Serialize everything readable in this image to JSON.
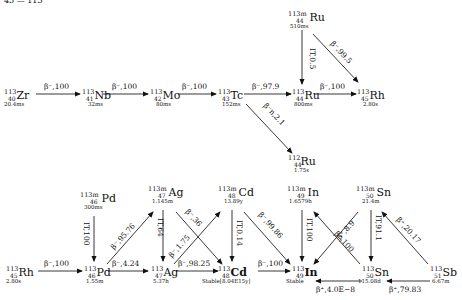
{
  "header": {
    "partial_text": "43 — 113"
  },
  "nuclides": {
    "zr113": {
      "a": "113",
      "z": "40",
      "sym": "Zr",
      "hl": "20.4ms"
    },
    "nb113": {
      "a": "113",
      "z": "41",
      "sym": "Nb",
      "hl": "32ms"
    },
    "mo113": {
      "a": "113",
      "z": "42",
      "sym": "Mo",
      "hl": "80ms"
    },
    "tc113": {
      "a": "113",
      "z": "43",
      "sym": "Tc",
      "hl": "152ms"
    },
    "ru113m": {
      "a": "113m",
      "z": "44",
      "sym": "Ru",
      "hl": "510ms"
    },
    "ru113": {
      "a": "113",
      "z": "44",
      "sym": "Ru",
      "hl": "800ms"
    },
    "rh113_top": {
      "a": "113",
      "z": "45",
      "sym": "Rh",
      "hl": "2.80s"
    },
    "ru112": {
      "a": "112",
      "z": "44",
      "sym": "Ru",
      "hl": "1.75s"
    },
    "pd113m": {
      "a": "113m",
      "z": "46",
      "sym": "Pd",
      "hl": "300ms"
    },
    "ag113m": {
      "a": "113m",
      "z": "47",
      "sym": "Ag",
      "hl": "1.145m"
    },
    "cd113m": {
      "a": "113m",
      "z": "48",
      "sym": "Cd",
      "hl": "13.89y"
    },
    "in113m": {
      "a": "113m",
      "z": "49",
      "sym": "In",
      "hl": "1.6579h"
    },
    "sn113m": {
      "a": "113m",
      "z": "50",
      "sym": "Sn",
      "hl": "21.4m"
    },
    "rh113": {
      "a": "113",
      "z": "45",
      "sym": "Rh",
      "hl": "2.80s"
    },
    "pd113": {
      "a": "113",
      "z": "46",
      "sym": "Pd",
      "hl": "1.55m"
    },
    "ag113": {
      "a": "113",
      "z": "47",
      "sym": "Ag",
      "hl": "5.37h"
    },
    "cd113": {
      "a": "113",
      "z": "48",
      "sym": "Cd",
      "hl": "Stable[8.04E15y]"
    },
    "in113": {
      "a": "113",
      "z": "49",
      "sym": "In",
      "hl": "Stable"
    },
    "sn113": {
      "a": "113",
      "z": "50",
      "sym": "Sn",
      "hl": "115.08d"
    },
    "sb113": {
      "a": "113",
      "z": "51",
      "sym": "Sb",
      "hl": "6.67m"
    }
  },
  "decays": [
    {
      "from": "Zr-113",
      "to": "Nb-113",
      "label": "β⁻,100"
    },
    {
      "from": "Nb-113",
      "to": "Mo-113",
      "label": "β⁻,100"
    },
    {
      "from": "Mo-113",
      "to": "Tc-113",
      "label": "β⁻,100"
    },
    {
      "from": "Tc-113",
      "to": "Ru-113",
      "label": "β⁻,97.9"
    },
    {
      "from": "Ru-113m",
      "to": "Ru-113",
      "label": "IT,0.5"
    },
    {
      "from": "Ru-113m",
      "to": "Rh-113",
      "label": "β⁻,99.5"
    },
    {
      "from": "Ru-113",
      "to": "Rh-113",
      "label": "β⁻,100"
    },
    {
      "from": "Tc-113",
      "to": "Ru-112",
      "label": "β⁻n,2.1"
    },
    {
      "from": "Rh-113",
      "to": "Pd-113",
      "label": "β⁻,100"
    },
    {
      "from": "Pd-113m",
      "to": "Pd-113",
      "label": "IT,100"
    },
    {
      "from": "Pd-113",
      "to": "Ag-113m",
      "label": "β⁻,95.76"
    },
    {
      "from": "Pd-113",
      "to": "Ag-113",
      "label": "β⁻,4.24"
    },
    {
      "from": "Ag-113m",
      "to": "Ag-113",
      "label": "IT,64"
    },
    {
      "from": "Ag-113m",
      "to": "Cd-113",
      "label": "β⁻,36"
    },
    {
      "from": "Ag-113",
      "to": "Cd-113m",
      "label": "β⁻,1.75"
    },
    {
      "from": "Ag-113",
      "to": "Cd-113",
      "label": "β⁻,98.25"
    },
    {
      "from": "Cd-113m",
      "to": "Cd-113",
      "label": "IT,0.14"
    },
    {
      "from": "Cd-113m",
      "to": "In-113",
      "label": "β⁻,99.86"
    },
    {
      "from": "Cd-113",
      "to": "In-113",
      "label": "β⁻,100"
    },
    {
      "from": "In-113m",
      "to": "In-113",
      "label": "IT,100"
    },
    {
      "from": "Sn-113",
      "to": "In-113m",
      "label": "β⁺,8.9"
    },
    {
      "from": "Sn-113m",
      "to": "In-113",
      "label": "β⁺,100"
    },
    {
      "from": "Sn-113m",
      "to": "Sn-113",
      "label": "IT,91.1"
    },
    {
      "from": "Sb-113",
      "to": "Sn-113m",
      "label": "β⁺,20.17"
    },
    {
      "from": "Sn-113",
      "to": "In-113",
      "label": "β⁺,4.0E−8"
    },
    {
      "from": "Sb-113",
      "to": "Sn-113",
      "label": "β⁺,79.83"
    }
  ],
  "labels": {
    "l0": "β⁻,100",
    "l1": "β⁻,100",
    "l2": "β⁻,100",
    "l3": "β⁻,97.9",
    "l4": "IT,0.5",
    "l5": "β⁻,99.5",
    "l6": "β⁻,100",
    "l7": "β⁻n,2.1",
    "l8": "β⁻,100",
    "l9": "IT,100",
    "l10": "β⁻,95.76",
    "l11": "β⁻,4.24",
    "l12": "IT,64",
    "l13": "β⁻,36",
    "l14": "β⁻,1.75",
    "l15": "β⁻,98.25",
    "l16": "IT,0.14",
    "l17": "β⁻,99.86",
    "l18": "β⁻,100",
    "l19": "IT,100",
    "l20": "β⁺,8.9",
    "l21": "β⁺,100",
    "l22": "IT,91.1",
    "l23": "β⁺,20.17",
    "l24": "β⁺,4.0E−8",
    "l25": "β⁺,79.83"
  }
}
